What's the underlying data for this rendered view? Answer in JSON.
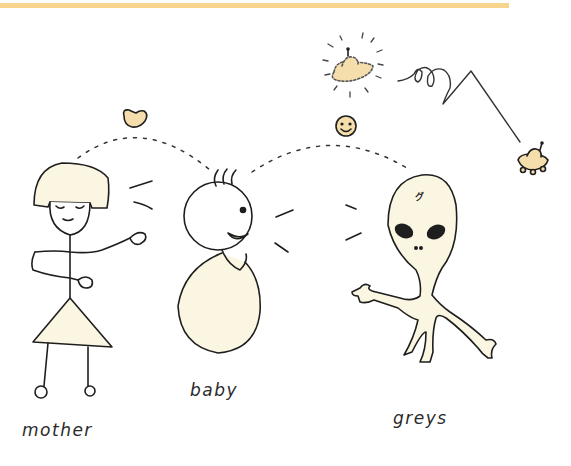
{
  "illustration": {
    "style": "hand-drawn pen sketch with pale cream fill",
    "colors": {
      "top_bar": "#f7d58e",
      "ink": "#1e1e1e",
      "fill_cream": "#fbf6e2",
      "accent_fill": "#f5deab",
      "dash": "#333333"
    },
    "characters": [
      {
        "id": "mother",
        "label": "mother"
      },
      {
        "id": "baby",
        "label": "baby"
      },
      {
        "id": "greys",
        "label": "greys",
        "forehead_mark": "グ"
      }
    ],
    "symbols": [
      {
        "name": "heart-icon",
        "between": [
          "mother",
          "baby"
        ]
      },
      {
        "name": "smiley-icon",
        "between": [
          "baby",
          "greys"
        ]
      },
      {
        "name": "glowing-ufo-icon",
        "position": "top"
      },
      {
        "name": "small-ufo-icon",
        "position": "right"
      }
    ]
  }
}
